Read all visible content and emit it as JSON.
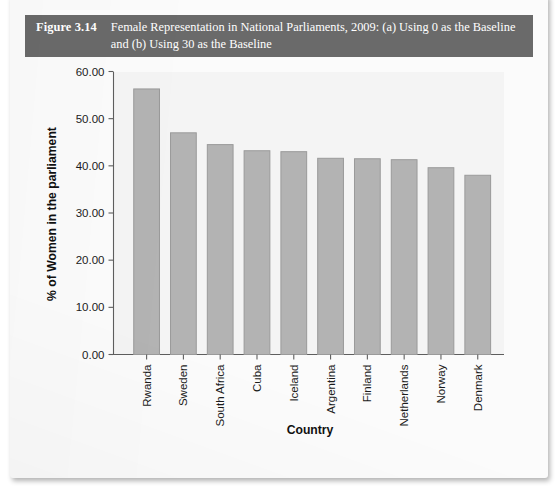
{
  "caption": {
    "label": "Figure 3.14",
    "text": "Female Representation in National Parliaments, 2009: (a) Using 0 as the Baseline and (b) Using 30 as the Baseline"
  },
  "colors": {
    "caption_bar": "#6a6a6a",
    "caption_text": "#ffffff",
    "bar_fill": "#b3b3b3",
    "bar_stroke": "#9a9a9a",
    "axis": "#5e5e5e",
    "page": "#fbfbfb",
    "plot_bg": "#f4f4f4"
  },
  "chart_data": {
    "type": "bar",
    "title": "Female Representation in National Parliaments, 2009: (a) Using 0 as the Baseline and (b) Using 30 as the Baseline",
    "xlabel": "Country",
    "ylabel": "% of Women in the parliament",
    "categories": [
      "Rwanda",
      "Sweden",
      "South Africa",
      "Cuba",
      "Iceland",
      "Argentina",
      "Finland",
      "Netherlands",
      "Norway",
      "Denmark"
    ],
    "values": [
      56.3,
      47.0,
      44.5,
      43.2,
      43.0,
      41.6,
      41.5,
      41.3,
      39.6,
      38.0
    ],
    "ylim": [
      0,
      60
    ],
    "yticks": [
      0,
      10,
      20,
      30,
      40,
      50,
      60
    ],
    "ytick_labels": [
      "0.00",
      "10.00",
      "20.00",
      "30.00",
      "40.00",
      "50.00",
      "60.00"
    ],
    "grid": false,
    "legend": null,
    "bar_color": "#b3b3b3"
  }
}
